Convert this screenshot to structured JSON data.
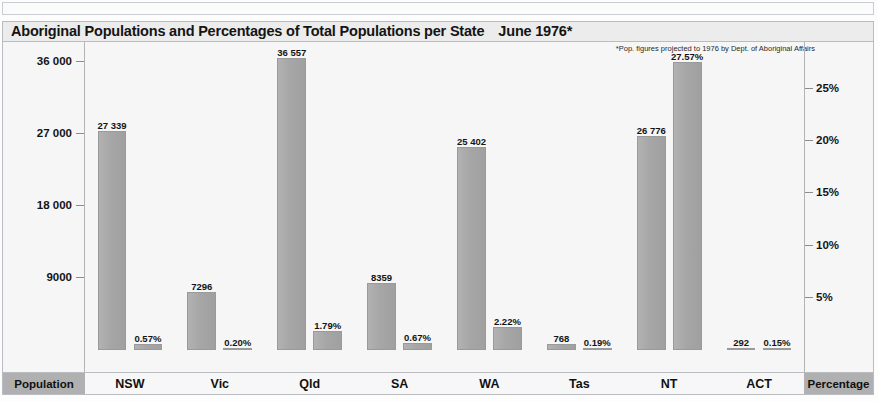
{
  "chart_data": {
    "type": "bar",
    "title": "Aboriginal Populations and Percentages of Total Populations per State",
    "date_label": "June 1976*",
    "footnote": "*Pop. figures projected to 1976 by Dept. of  Aboriginal Affairs",
    "categories": [
      "NSW",
      "Vic",
      "Qld",
      "SA",
      "WA",
      "Tas",
      "NT",
      "ACT"
    ],
    "series": [
      {
        "name": "Population",
        "axis": "left",
        "values": [
          27339,
          7296,
          36557,
          8359,
          25402,
          768,
          26776,
          292
        ],
        "labels": [
          "27 339",
          "7296",
          "36 557",
          "8359",
          "25 402",
          "768",
          "26 776",
          "292"
        ]
      },
      {
        "name": "Percentage",
        "axis": "right",
        "values": [
          0.57,
          0.2,
          1.79,
          0.67,
          2.22,
          0.19,
          27.57,
          0.15
        ],
        "labels": [
          "0.57%",
          "0.20%",
          "1.79%",
          "0.67%",
          "2.22%",
          "0.19%",
          "27.57%",
          "0.15%"
        ]
      }
    ],
    "left_axis": {
      "label": "Population",
      "ticks": [
        36000,
        27000,
        18000,
        9000
      ],
      "tick_labels": [
        "36 000",
        "27 000",
        "18 000",
        "9000"
      ],
      "ylim": [
        0,
        38500
      ]
    },
    "right_axis": {
      "label": "Percentage",
      "ticks": [
        25,
        20,
        15,
        10,
        5
      ],
      "tick_labels": [
        "25%",
        "20%",
        "15%",
        "10%",
        "5%"
      ],
      "ylim": [
        0,
        29.5
      ]
    },
    "grid": false,
    "legend": "none",
    "colors": {
      "bar": "#a9a9a9",
      "plot_background": "#f6f6f6",
      "title_background": "#ececec",
      "endcap_background": "#b0b0b0",
      "text": "#141414"
    }
  }
}
